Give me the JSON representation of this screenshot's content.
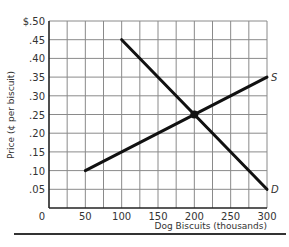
{
  "chart_data": {
    "type": "line",
    "title": "",
    "xlabel": "Dog Biscuits (thousands)",
    "ylabel": "Price (¢ per biscuit)",
    "xlim": [
      0,
      300
    ],
    "ylim": [
      0,
      0.5
    ],
    "grid": true,
    "x_ticks": [
      0,
      50,
      100,
      150,
      200,
      250,
      300
    ],
    "x_tick_labels": [
      "0",
      "50",
      "100",
      "150",
      "200",
      "250",
      "300"
    ],
    "y_ticks": [
      0.05,
      0.1,
      0.15,
      0.2,
      0.25,
      0.3,
      0.35,
      0.4,
      0.45,
      0.5
    ],
    "y_tick_labels": [
      ".05",
      ".10",
      ".15",
      ".20",
      ".25",
      ".30",
      ".35",
      ".40",
      ".45",
      "$.50"
    ],
    "series": [
      {
        "name": "S",
        "label": "S",
        "x": [
          50,
          300
        ],
        "y": [
          0.1,
          0.35
        ]
      },
      {
        "name": "D",
        "label": "D",
        "x": [
          100,
          300
        ],
        "y": [
          0.45,
          0.05
        ]
      }
    ],
    "annotations": [
      {
        "type": "point",
        "x": 200,
        "y": 0.25,
        "label": "equilibrium"
      }
    ]
  }
}
